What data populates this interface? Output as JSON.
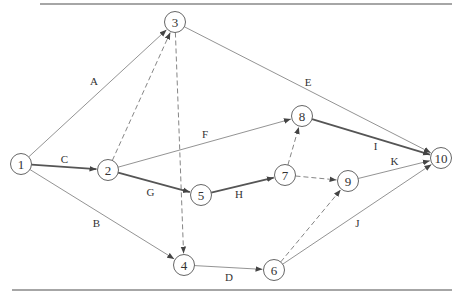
{
  "diagram": {
    "type": "activity-on-arrow network",
    "nodes": [
      {
        "id": "1",
        "label": "1"
      },
      {
        "id": "2",
        "label": "2"
      },
      {
        "id": "3",
        "label": "3"
      },
      {
        "id": "4",
        "label": "4"
      },
      {
        "id": "5",
        "label": "5"
      },
      {
        "id": "6",
        "label": "6"
      },
      {
        "id": "7",
        "label": "7"
      },
      {
        "id": "8",
        "label": "8"
      },
      {
        "id": "9",
        "label": "9"
      },
      {
        "id": "10",
        "label": "10"
      }
    ],
    "edges": [
      {
        "from": "1",
        "to": "3",
        "label": "A",
        "style": "solid"
      },
      {
        "from": "1",
        "to": "4",
        "label": "B",
        "style": "solid"
      },
      {
        "from": "1",
        "to": "2",
        "label": "C",
        "style": "critical"
      },
      {
        "from": "4",
        "to": "6",
        "label": "D",
        "style": "solid"
      },
      {
        "from": "3",
        "to": "10",
        "label": "E",
        "style": "solid"
      },
      {
        "from": "2",
        "to": "8",
        "label": "F",
        "style": "solid"
      },
      {
        "from": "2",
        "to": "5",
        "label": "G",
        "style": "critical"
      },
      {
        "from": "5",
        "to": "7",
        "label": "H",
        "style": "critical"
      },
      {
        "from": "8",
        "to": "10",
        "label": "I",
        "style": "critical"
      },
      {
        "from": "6",
        "to": "10",
        "label": "J",
        "style": "solid"
      },
      {
        "from": "9",
        "to": "10",
        "label": "K",
        "style": "solid"
      },
      {
        "from": "2",
        "to": "3",
        "label": "",
        "style": "dummy"
      },
      {
        "from": "3",
        "to": "4",
        "label": "",
        "style": "dummy"
      },
      {
        "from": "7",
        "to": "8",
        "label": "",
        "style": "dummy"
      },
      {
        "from": "7",
        "to": "9",
        "label": "",
        "style": "dummy"
      },
      {
        "from": "6",
        "to": "9",
        "label": "",
        "style": "dummy"
      }
    ]
  }
}
